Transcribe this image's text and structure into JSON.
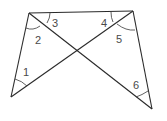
{
  "diagram": {
    "type": "geometry",
    "line_color": "#2a2a2a",
    "arc_color": "#3a3a3a",
    "label_color": "#4a4a4a",
    "vertices": {
      "top_left": [
        29,
        13
      ],
      "top_right": [
        133,
        11
      ],
      "bottom_left": [
        11,
        97
      ],
      "bottom_right": [
        152,
        109
      ]
    },
    "angle_labels": [
      {
        "id": "1",
        "text": "1",
        "x": 24,
        "y": 75
      },
      {
        "id": "2",
        "text": "2",
        "x": 35,
        "y": 43
      },
      {
        "id": "3",
        "text": "3",
        "x": 52,
        "y": 26
      },
      {
        "id": "4",
        "text": "4",
        "x": 101,
        "y": 26
      },
      {
        "id": "5",
        "text": "5",
        "x": 116,
        "y": 42
      },
      {
        "id": "6",
        "text": "6",
        "x": 133,
        "y": 88
      }
    ]
  }
}
